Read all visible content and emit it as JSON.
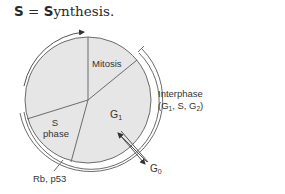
{
  "header": {
    "abbrev": "S",
    "equals": " = ",
    "word_initial": "S",
    "word_rest": "ynthesis."
  },
  "diagram": {
    "phases": {
      "mitosis": "Mitosis",
      "g1_main": "G",
      "g1_sub": "1",
      "s_line1": "S",
      "s_line2": "phase"
    },
    "interphase": {
      "line1": "Interphase",
      "line2_open": "(G",
      "line2_sub1": "1",
      "line2_mid": ", S, G",
      "line2_sub2": "2",
      "line2_close": ")"
    },
    "g0": {
      "main": "G",
      "sub": "0"
    },
    "regulators": "Rb, p53",
    "colors": {
      "circle_fill": "#e6e6e6",
      "line": "#6b6b6b",
      "text": "#333333"
    }
  }
}
